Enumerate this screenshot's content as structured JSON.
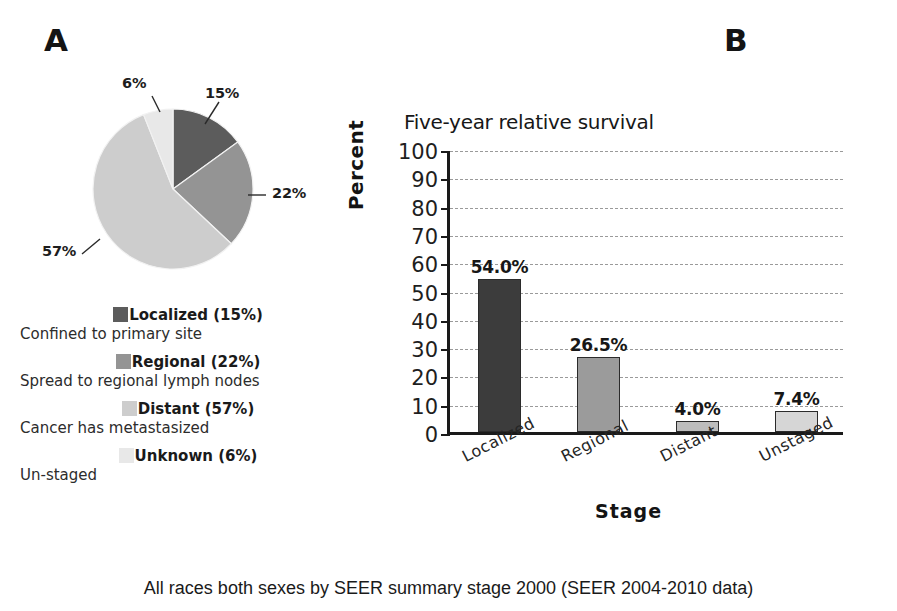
{
  "figure": {
    "caption": "All races both sexes by SEER summary stage 2000 (SEER 2004-2010 data)"
  },
  "panel_a": {
    "letter": "A",
    "callouts": {
      "unknown": "6%",
      "localized": "15%",
      "regional": "22%",
      "distant": "57%"
    },
    "legend": [
      {
        "title": "Localized (15%)",
        "desc": "Confined to primary site",
        "color": "#5c5c5c"
      },
      {
        "title": "Regional (22%)",
        "desc": "Spread to regional lymph nodes",
        "color": "#949494"
      },
      {
        "title": "Distant (57%)",
        "desc": "Cancer has metastasized",
        "color": "#cdcdcd"
      },
      {
        "title": "Unknown (6%)",
        "desc": "Un-staged",
        "color": "#e8e8e8"
      }
    ],
    "chart_data": {
      "type": "pie",
      "title": "",
      "categories": [
        "Localized",
        "Regional",
        "Distant",
        "Unknown"
      ],
      "values": [
        15,
        22,
        57,
        6
      ],
      "labels": [
        "15%",
        "22%",
        "57%",
        "6%"
      ],
      "colors": [
        "#5c5c5c",
        "#949494",
        "#cdcdcd",
        "#e8e8e8"
      ],
      "start_angle_deg": 0,
      "direction": "clockwise",
      "legend_position": "below"
    }
  },
  "panel_b": {
    "letter": "B",
    "title": "Five-year relative survival",
    "y_axis_label": "Percent",
    "x_axis_label": "Stage",
    "y_ticks": [
      "100",
      "90",
      "80",
      "70",
      "60",
      "50",
      "40",
      "30",
      "20",
      "10",
      "0"
    ],
    "chart_data": {
      "type": "bar",
      "title": "Five-year relative survival",
      "xlabel": "Stage",
      "ylabel": "Percent",
      "categories": [
        "Localized",
        "Regional",
        "Distant",
        "Unstaged"
      ],
      "values": [
        54.0,
        26.5,
        4.0,
        7.4
      ],
      "data_labels": [
        "54.0%",
        "26.5%",
        "4.0%",
        "7.4%"
      ],
      "bar_colors": [
        "#3c3c3c",
        "#9b9b9b",
        "#bdbdbd",
        "#d6d6d6"
      ],
      "ylim": [
        0,
        100
      ],
      "ytick_step": 10,
      "grid": true,
      "grid_style": "dashed-horizontal",
      "legend_position": "none"
    }
  }
}
